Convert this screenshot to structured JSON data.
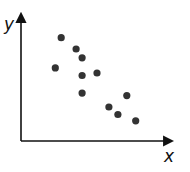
{
  "chart_data": {
    "type": "scatter",
    "title": "",
    "xlabel": "x",
    "ylabel": "y",
    "xlim": [
      0,
      10
    ],
    "ylim": [
      0,
      10
    ],
    "grid": false,
    "legend": null,
    "ticks": "none",
    "series": [
      {
        "name": "points",
        "color": "#333333",
        "points": [
          {
            "x": 2.3,
            "y": 5.8
          },
          {
            "x": 2.7,
            "y": 8.2
          },
          {
            "x": 3.7,
            "y": 7.3
          },
          {
            "x": 4.1,
            "y": 6.6
          },
          {
            "x": 4.1,
            "y": 5.2
          },
          {
            "x": 5.1,
            "y": 5.4
          },
          {
            "x": 4.1,
            "y": 3.8
          },
          {
            "x": 5.9,
            "y": 2.7
          },
          {
            "x": 7.1,
            "y": 3.6
          },
          {
            "x": 6.5,
            "y": 2.1
          },
          {
            "x": 7.7,
            "y": 1.6
          }
        ]
      }
    ],
    "annotations": []
  },
  "colors": {
    "axis": "#111111",
    "point": "#333333",
    "background": "#ffffff"
  },
  "labels": {
    "x_axis": "x",
    "y_axis": "y"
  }
}
